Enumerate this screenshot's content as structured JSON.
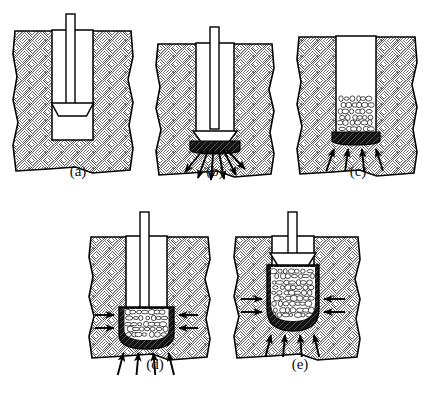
{
  "figure": {
    "background_color": "#ffffff",
    "line_color": "#000000",
    "soil_hatch_color": "#555555",
    "aggregate_fill_color": "#ffffff",
    "compacted_zone_color": "#1a1a1a",
    "cavity_color": "#ffffff",
    "width": 430,
    "height": 393
  },
  "panels": [
    {
      "id": "a",
      "caption": "(a)",
      "caption_x": 78,
      "caption_y": 176,
      "origin_x": 12,
      "origin_y": 14,
      "description": "Tamper rod with trapezoidal foot lowered into an open borehole in soil",
      "has_rod": true,
      "has_tamper_foot": true,
      "tamper_foot_y": 103,
      "has_aggregate": false,
      "has_compacted_bulb": false,
      "side_arrows": 0,
      "bottom_arrows": 0,
      "radiating_arrows": 0,
      "cavity": {
        "x": 52,
        "y": 31,
        "w": 41,
        "h": 109
      },
      "rod": {
        "x": 66,
        "y": 14,
        "w": 9,
        "h": 90
      }
    },
    {
      "id": "b",
      "caption": "(b)",
      "caption_x": 215,
      "caption_y": 176,
      "origin_x": 155,
      "origin_y": 27,
      "description": "Tamper rams the hole bottom, forming a dense compacted bulb; stresses radiate outward and downward",
      "has_rod": true,
      "has_tamper_foot": true,
      "tamper_foot_y": 131,
      "has_aggregate": false,
      "has_compacted_bulb": true,
      "side_arrows": 0,
      "bottom_arrows": 0,
      "radiating_arrows": 6,
      "cavity": {
        "x": 196,
        "y": 44,
        "w": 38,
        "h": 88
      },
      "rod": {
        "x": 210,
        "y": 27,
        "w": 9,
        "h": 105
      }
    },
    {
      "id": "c",
      "caption": "(c)",
      "caption_x": 358,
      "caption_y": 176,
      "origin_x": 296,
      "origin_y": 32,
      "description": "First lift of open-graded aggregate placed in the cavity over the compacted base",
      "has_rod": false,
      "has_tamper_foot": false,
      "has_aggregate": true,
      "has_compacted_bulb": true,
      "side_arrows": 0,
      "bottom_arrows": 4,
      "radiating_arrows": 0,
      "cavity": {
        "x": 336,
        "y": 37,
        "w": 40,
        "h": 105
      }
    },
    {
      "id": "d",
      "caption": "(d)",
      "caption_x": 155,
      "caption_y": 369,
      "origin_x": 88,
      "origin_y": 212,
      "description": "Aggregate lift rammed into a bulged pier bottom; lateral stress pushes into surrounding soil and vertical stress into bearing layer",
      "has_rod": true,
      "has_tamper_foot": false,
      "has_aggregate": true,
      "has_compacted_bulb": true,
      "side_arrows": 4,
      "bottom_arrows": 4,
      "radiating_arrows": 0,
      "cavity": {
        "x": 126,
        "y": 237,
        "w": 41,
        "h": 72
      },
      "rod": {
        "x": 140,
        "y": 212,
        "w": 9,
        "h": 97
      }
    },
    {
      "id": "e",
      "caption": "(e)",
      "caption_x": 300,
      "caption_y": 369,
      "origin_x": 233,
      "origin_y": 212,
      "description": "Successive lifts build the completed aggregate pier; tamper raised above the densified column",
      "has_rod": true,
      "has_tamper_foot": true,
      "tamper_foot_y": 253,
      "has_aggregate": true,
      "has_compacted_bulb": true,
      "side_arrows": 4,
      "bottom_arrows": 4,
      "radiating_arrows": 0,
      "cavity": {
        "x": 272,
        "y": 237,
        "w": 42,
        "h": 78
      },
      "rod": {
        "x": 288,
        "y": 212,
        "w": 9,
        "h": 42
      }
    }
  ]
}
